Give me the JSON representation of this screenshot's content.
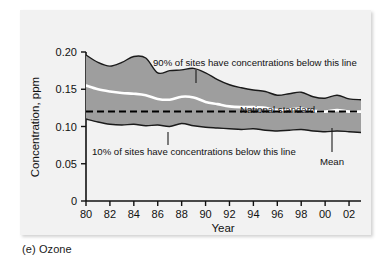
{
  "figure": {
    "caption": "(e) Ozone",
    "panel_bg_color": "#f2f2f2",
    "band_fill_color": "#9e9e9e",
    "band_edge_color": "#1a1a1a",
    "mean_line_color": "#ffffff",
    "standard_line_color": "#000000"
  },
  "chart_data": {
    "type": "area",
    "title": "",
    "subtitle": "",
    "xlabel": "Year",
    "ylabel": "Concentration, ppm",
    "xlim": [
      1980,
      2003
    ],
    "ylim": [
      0,
      0.2
    ],
    "grid": false,
    "legend_position": "none",
    "x_tick_labels": [
      "80",
      "82",
      "84",
      "86",
      "88",
      "90",
      "92",
      "94",
      "96",
      "98",
      "00",
      "02"
    ],
    "x_tick_values": [
      1980,
      1982,
      1984,
      1986,
      1988,
      1990,
      1992,
      1994,
      1996,
      1998,
      2000,
      2002
    ],
    "y_tick_labels": [
      "0.20",
      "0.15",
      "0.10",
      "0.05",
      "0"
    ],
    "y_tick_values": [
      0.2,
      0.15,
      0.1,
      0.05,
      0
    ],
    "x": [
      1980,
      1981,
      1982,
      1983,
      1984,
      1985,
      1986,
      1987,
      1988,
      1989,
      1990,
      1991,
      1992,
      1993,
      1994,
      1995,
      1996,
      1997,
      1998,
      1999,
      2000,
      2001,
      2002,
      2003
    ],
    "series": [
      {
        "name": "90th percentile",
        "label": "90% of sites have concentrations below this line",
        "values": [
          0.196,
          0.186,
          0.181,
          0.186,
          0.194,
          0.192,
          0.172,
          0.175,
          0.176,
          0.178,
          0.172,
          0.163,
          0.156,
          0.152,
          0.149,
          0.147,
          0.142,
          0.144,
          0.146,
          0.14,
          0.138,
          0.142,
          0.137,
          0.136
        ]
      },
      {
        "name": "mean",
        "label": "Mean",
        "values": [
          0.155,
          0.15,
          0.147,
          0.145,
          0.144,
          0.142,
          0.137,
          0.136,
          0.14,
          0.139,
          0.133,
          0.13,
          0.127,
          0.126,
          0.126,
          0.125,
          0.122,
          0.123,
          0.124,
          0.121,
          0.12,
          0.122,
          0.12,
          0.12
        ]
      },
      {
        "name": "10th percentile",
        "label": "10% of sites have concentrations below this line",
        "values": [
          0.11,
          0.106,
          0.103,
          0.102,
          0.103,
          0.101,
          0.102,
          0.1,
          0.104,
          0.101,
          0.099,
          0.098,
          0.097,
          0.096,
          0.097,
          0.095,
          0.094,
          0.095,
          0.096,
          0.094,
          0.093,
          0.094,
          0.093,
          0.092
        ]
      }
    ],
    "reference_line": {
      "name": "National standard",
      "label": "National standard",
      "value": 0.12,
      "style": "dashed"
    },
    "annotations": [
      {
        "id": "upper-band-annotation",
        "text": "90% of sites have concentrations below this line",
        "anchor_year": 1991,
        "anchor_value": 0.173
      },
      {
        "id": "standard-annotation",
        "text": "National standard",
        "anchor_year": 1993,
        "anchor_value": 0.12
      },
      {
        "id": "lower-band-annotation",
        "text": "10% of sites have concentrations below this line",
        "anchor_year": 1988.5,
        "anchor_value": 0.104
      },
      {
        "id": "mean-annotation",
        "text": "Mean",
        "anchor_year": 2001.5,
        "anchor_value": 0.121
      }
    ]
  }
}
